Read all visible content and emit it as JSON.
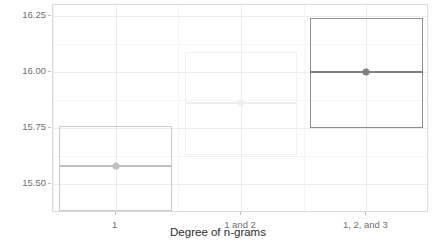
{
  "chart_data": {
    "type": "box",
    "title": "",
    "xlabel": "Degree of n-grams",
    "ylabel": "RMSE",
    "categories": [
      "1",
      "1 and 2",
      "1, 2, and 3"
    ],
    "ylim": [
      15.37,
      16.3
    ],
    "y_ticks": [
      15.5,
      15.75,
      16.0,
      16.25
    ],
    "y_tick_labels": [
      "15.50",
      "15.75",
      "16.00",
      "16.25"
    ],
    "grid": true,
    "legend": "none",
    "boxes": [
      {
        "category": "1",
        "lower": 15.38,
        "median": 15.58,
        "upper": 15.76,
        "color": "#cccccc",
        "median_color": "#bfbfbf"
      },
      {
        "category": "1 and 2",
        "lower": 15.63,
        "median": 15.86,
        "upper": 16.09,
        "color": "#f0f0f0",
        "median_color": "#ededed"
      },
      {
        "category": "1, 2, and 3",
        "lower": 15.75,
        "median": 16.0,
        "upper": 16.24,
        "color": "#8f8f8f",
        "median_color": "#7f7f7f"
      }
    ]
  },
  "axis": {
    "x_title": "Degree of n-grams",
    "y_title": "RMSE"
  }
}
